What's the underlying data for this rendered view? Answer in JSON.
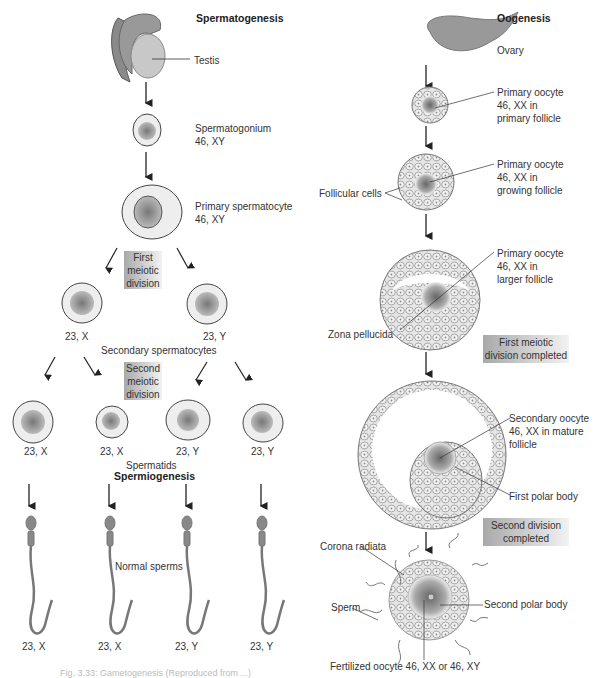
{
  "spermatogenesis": {
    "title": "Spermatogenesis",
    "testis": "Testis",
    "spermatogonium": "Spermatogonium\n46, XY",
    "primary_spermatocyte": "Primary spermatocyte\n46, XY",
    "first_meiotic_division": "First\nmeiotic\ndivision",
    "secondary_labels": [
      "23, X",
      "23, Y"
    ],
    "secondary_spermatocytes": "Secondary spermatocytes",
    "second_meiotic_division": "Second\nmeiotic\ndivision",
    "spermatid_labels": [
      "23, X",
      "23, X",
      "23, Y",
      "23, Y"
    ],
    "spermatids": "Spermatids",
    "spermiogenesis": "Spermiogenesis",
    "normal_sperms": "Normal sperms",
    "sperm_labels": [
      "23, X",
      "23, X",
      "23, Y",
      "23, Y"
    ]
  },
  "oogenesis": {
    "title": "Oogenesis",
    "ovary": "Ovary",
    "primary_follicle": "Primary oocyte\n46, XX in\nprimary follicle",
    "growing_follicle": "Primary oocyte\n46, XX in\ngrowing follicle",
    "follicular_cells": "Follicular cells",
    "larger_follicle": "Primary oocyte\n46, XX in\nlarger follicle",
    "zona_pellucida": "Zona pellucida",
    "first_meiotic_completed": "First meiotic\ndivision completed",
    "mature_follicle": "Secondary oocyte\n46, XX in mature follicle",
    "first_polar_body": "First polar body",
    "second_division_completed": "Second division\ncompleted",
    "corona_radiata": "Corona radiata",
    "sperm": "Sperm",
    "second_polar_body": "Second polar body",
    "fertilized_oocyte": "Fertilized oocyte 46, XX or 46, XY"
  },
  "caption": "Fig. 3.33: Gametogenesis (Reproduced from ...)"
}
